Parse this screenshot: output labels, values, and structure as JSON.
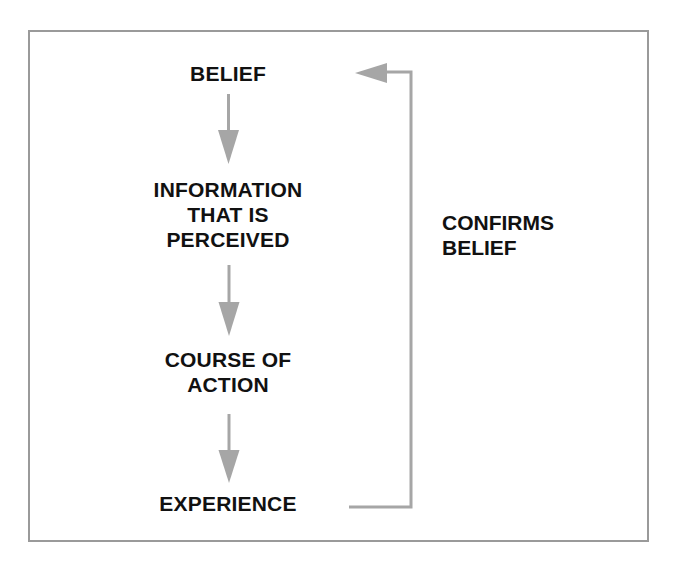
{
  "diagram": {
    "type": "flowchart",
    "nodes": [
      {
        "id": "belief",
        "lines": [
          "BELIEF"
        ]
      },
      {
        "id": "information",
        "lines": [
          "INFORMATION",
          "THAT IS",
          "PERCEIVED"
        ]
      },
      {
        "id": "course",
        "lines": [
          "COURSE OF",
          "ACTION"
        ]
      },
      {
        "id": "experience",
        "lines": [
          "EXPERIENCE"
        ]
      }
    ],
    "edges": [
      {
        "from": "belief",
        "to": "information"
      },
      {
        "from": "information",
        "to": "course"
      },
      {
        "from": "course",
        "to": "experience"
      },
      {
        "from": "experience",
        "to": "belief",
        "label": "CONFIRMS BELIEF"
      }
    ],
    "feedback_label": [
      "CONFIRMS",
      "BELIEF"
    ],
    "colors": {
      "arrow": "#a6a6a6",
      "border": "#9a9a9a",
      "text": "#111111"
    }
  }
}
